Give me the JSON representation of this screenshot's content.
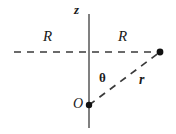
{
  "figure": {
    "labels": {
      "z_axis": "z",
      "radius_left": "R",
      "radius_right": "R",
      "angle": "θ",
      "radial_distance": "r",
      "origin": "O"
    },
    "colors": {
      "axis": "#808080",
      "dashed_line": "#3a3a3a",
      "point": "#111111",
      "text": "#1a1a1a",
      "background": "#ffffff"
    },
    "geometry": {
      "z_axis": {
        "x": 89,
        "y_top": 14,
        "y_bottom": 128
      },
      "horizontal_dashed_line": {
        "y": 52,
        "x_start": 14,
        "x_end": 160
      },
      "diagonal_dashed_line": {
        "x1": 89,
        "y1": 105,
        "x2": 160,
        "y2": 52
      },
      "origin_point": {
        "x": 89,
        "y": 105,
        "radius": 3.2
      },
      "field_point": {
        "x": 160,
        "y": 52,
        "radius": 3.4
      }
    }
  }
}
